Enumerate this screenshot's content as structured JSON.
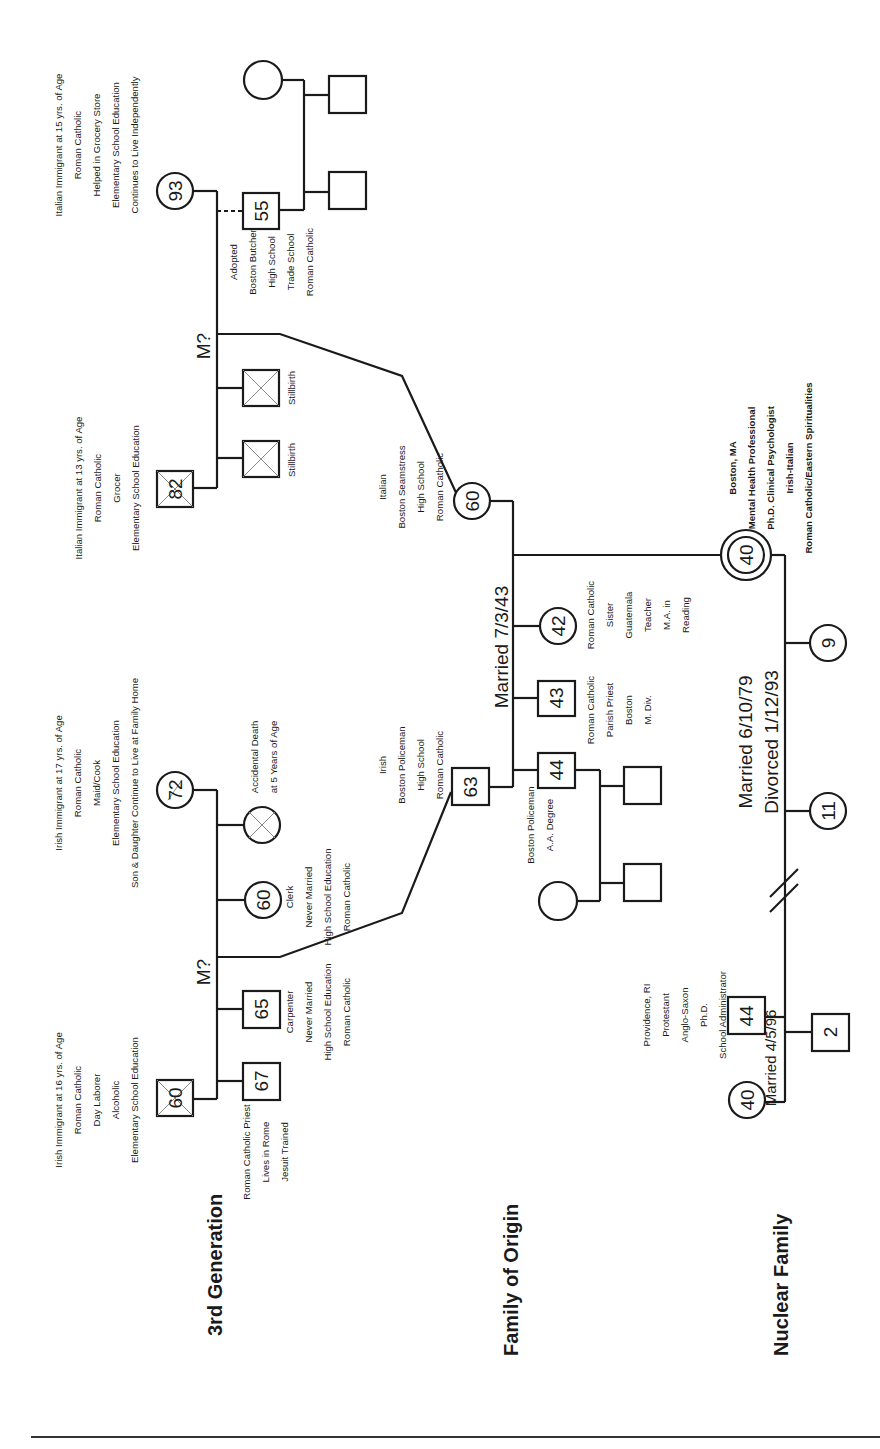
{
  "sections": {
    "third_generation": "3rd Generation",
    "family_of_origin": "Family of Origin",
    "nuclear_family": "Nuclear Family"
  },
  "italian_grandparents": {
    "grandmother": {
      "age": "93",
      "notes": [
        "Italian Immigrant at 15 yrs. of Age",
        "Roman Catholic",
        "Helped in Grocery Store",
        "Elementary School Education",
        "Continues to Live Independently"
      ]
    },
    "grandfather": {
      "age": "82",
      "deceased": true,
      "notes": [
        "Italian Immigrant at 13 yrs. of Age",
        "Roman Catholic",
        "Grocer",
        "Elementary School Education"
      ]
    },
    "marriage_label": "M?",
    "adopted_son": {
      "age": "55",
      "notes": [
        "Adopted",
        "Boston Butcher",
        "High School",
        "Trade School",
        "Roman Catholic"
      ]
    },
    "stillbirth_1": "Stillbirth",
    "stillbirth_2": "Stillbirth"
  },
  "irish_grandparents": {
    "grandmother": {
      "age": "72",
      "notes": [
        "Irish Immigrant at 17 yrs. of Age",
        "Roman Catholic",
        "Maid/Cook",
        "Elementary School Education",
        "Son & Daughter Continue to Live at Family Home"
      ]
    },
    "grandfather": {
      "age": "60",
      "deceased": true,
      "notes": [
        "Irish Immigrant at 16 yrs. of Age",
        "Roman Catholic",
        "Day Laborer",
        "Alcoholic",
        "Elementary School Education"
      ]
    },
    "marriage_label": "M?",
    "child_died": {
      "notes": [
        "Accidental Death",
        "at 5 Years of Age"
      ]
    },
    "daughter": {
      "age": "60",
      "notes": [
        "Clerk",
        "Never Married",
        "High School Education",
        "Roman Catholic"
      ]
    },
    "son_carpenter": {
      "age": "65",
      "notes": [
        "Carpenter",
        "Never Married",
        "High School Education",
        "Roman Catholic"
      ]
    },
    "son_priest": {
      "age": "67",
      "notes": [
        "Roman Catholic Priest",
        "Lives in Rome",
        "Jesuit Trained"
      ]
    }
  },
  "family_of_origin": {
    "mother": {
      "age": "60",
      "notes": [
        "Italian",
        "Boston Seamstress",
        "High School",
        "Roman Catholic"
      ]
    },
    "father": {
      "age": "63",
      "notes": [
        "Irish",
        "Boston Policeman",
        "High School",
        "Roman Catholic"
      ]
    },
    "marriage_label": "Married 7/3/43",
    "brother_44": {
      "age": "44",
      "notes": [
        "Boston Policeman",
        "A.A. Degree"
      ]
    },
    "brother_43": {
      "age": "43",
      "notes": [
        "Roman Catholic",
        "Parish Priest",
        "Boston",
        "M. Div."
      ]
    },
    "sister_42": {
      "age": "42",
      "notes": [
        "Roman Catholic",
        "Sister",
        "Guatemala",
        "Teacher",
        "M.A. in",
        "Reading"
      ]
    },
    "client": {
      "age": "40",
      "notes": [
        "Boston, MA",
        "Mental Health Professional",
        "Ph.D. Clinical Psychologist",
        "Irish-Italian",
        "Roman Catholic/Eastern Spiritualities"
      ]
    }
  },
  "nuclear_family": {
    "first_marriage_label": [
      "Married 6/10/79",
      "Divorced 1/12/93"
    ],
    "child_9": {
      "age": "9"
    },
    "child_11": {
      "age": "11"
    },
    "ex_husband": {
      "age": "44",
      "notes": [
        "Providence, RI",
        "Protestant",
        "Anglo-Saxon",
        "Ph.D.",
        "School Administrator"
      ]
    },
    "second_marriage_label": "Married 4/5/96",
    "second_wife": {
      "age": "40"
    },
    "child_2": {
      "age": "2"
    }
  }
}
